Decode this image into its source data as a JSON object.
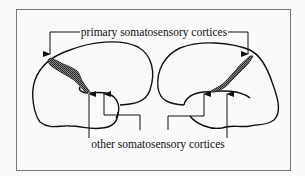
{
  "diagram": {
    "top_label": "primary somatosensory cortices",
    "bottom_label": "other somatosensory cortices",
    "colors": {
      "background": "#fafafa",
      "frame": "#777777",
      "line": "#111111",
      "shading": "#555555"
    },
    "hemispheres": [
      "left-hemisphere",
      "right-hemisphere"
    ]
  }
}
